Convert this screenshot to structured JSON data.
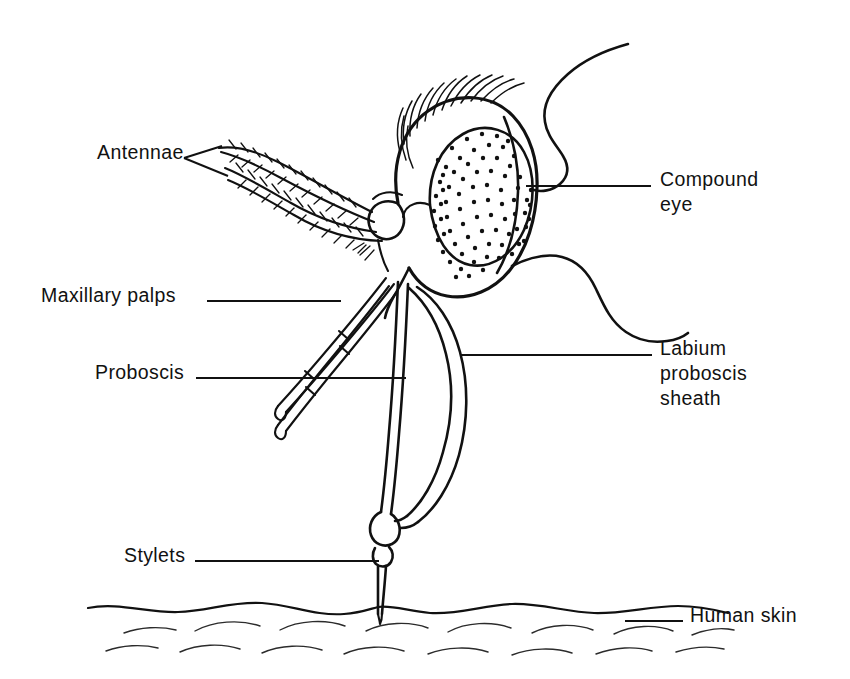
{
  "figure": {
    "background_color": "#ffffff",
    "ink_color": "#111111",
    "width": 850,
    "height": 679
  },
  "labels": {
    "antennae": "Antennae",
    "maxillary_palps": "Maxillary palps",
    "proboscis": "Proboscis",
    "stylets": "Stylets",
    "compound_eye_line1": "Compound",
    "compound_eye_line2": "eye",
    "labium_line1": "Labium",
    "labium_line2": "proboscis",
    "labium_line3": "sheath",
    "human_skin": "Human skin"
  },
  "parts": {
    "head_capsule": "head-capsule",
    "compound_eye": "compound-eye",
    "eye_stipple": "compound-eye-stipple",
    "head_hair_tuft": "head-hair-tuft",
    "antenna_socket": "antenna-socket",
    "antenna_upper": "antenna-upper",
    "antenna_lower": "antenna-lower",
    "thorax_upper": "thorax-upper-contour",
    "thorax_lower": "thorax-lower-contour",
    "palp_upper": "maxillary-palp-upper",
    "palp_lower": "maxillary-palp-lower",
    "labium": "labium-proboscis-sheath",
    "stylet_bundle": "stylet-bundle",
    "stylet_bulb": "stylet-bulb",
    "skin_surface": "human-skin-surface"
  }
}
